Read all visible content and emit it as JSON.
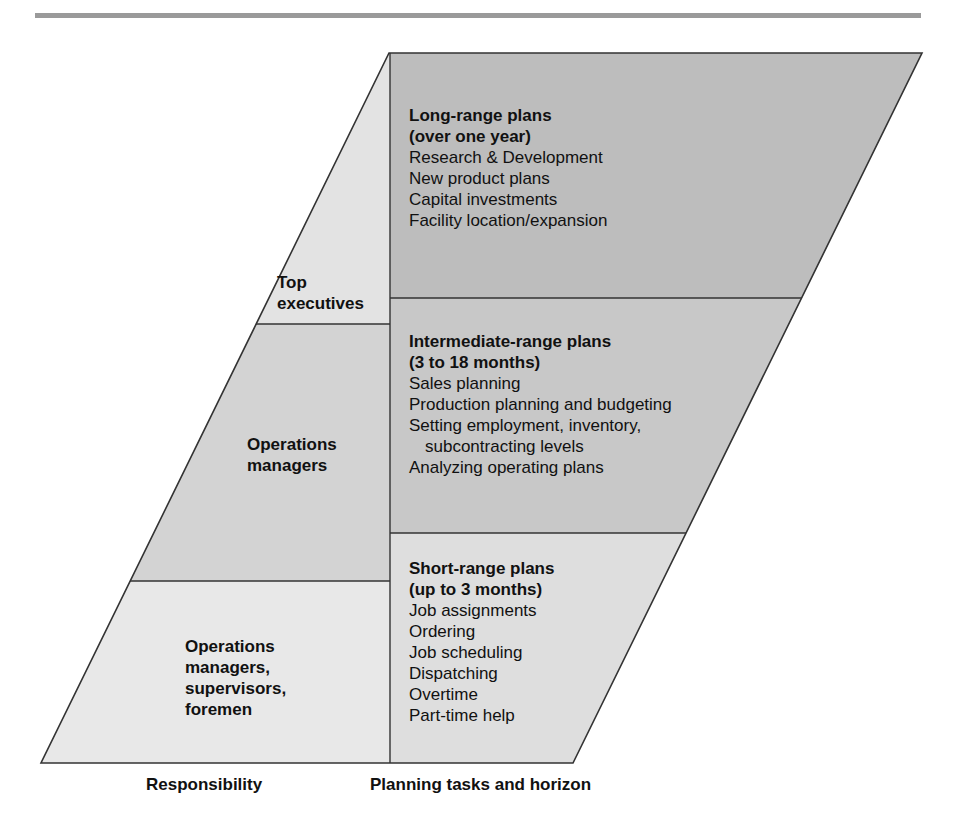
{
  "figure": {
    "colors": {
      "long_range_fill": "#bdbdbd",
      "intermediate_fill": "#c8c8c8",
      "short_range_fill": "#dedede",
      "top_exec_fill": "#e3e3e3",
      "ops_managers_fill": "#d3d3d3",
      "supervisors_fill": "#e8e8e8",
      "line": "#333333",
      "header_band": "#9a9a9a"
    }
  },
  "responsibility": [
    {
      "label_lines": [
        "Top",
        "executives"
      ]
    },
    {
      "label_lines": [
        "Operations",
        "managers"
      ]
    },
    {
      "label_lines": [
        "Operations",
        "managers,",
        "supervisors,",
        "foremen"
      ]
    }
  ],
  "plans": [
    {
      "title_lines": [
        "Long-range plans",
        "(over one year)"
      ],
      "items": [
        "Research & Development",
        "New product plans",
        "Capital investments",
        "Facility location/expansion"
      ]
    },
    {
      "title_lines": [
        "Intermediate-range plans",
        "(3 to 18 months)"
      ],
      "items": [
        "Sales planning",
        "Production planning and budgeting",
        "Setting employment, inventory,",
        "subcontracting levels",
        "Analyzing operating plans"
      ]
    },
    {
      "title_lines": [
        "Short-range plans",
        "(up to 3 months)"
      ],
      "items": [
        "Job assignments",
        "Ordering",
        "Job scheduling",
        "Dispatching",
        "Overtime",
        "Part-time help"
      ]
    }
  ],
  "axis_labels": {
    "left": "Responsibility",
    "right": "Planning tasks and horizon"
  }
}
